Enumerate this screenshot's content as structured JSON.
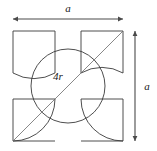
{
  "figure": {
    "kind": "geometry-diagram",
    "background_color": "#ffffff",
    "stroke_color": "#3a3a3a",
    "thin_stroke_color": "#555555",
    "dimension_color": "#4a4a4a",
    "labels": {
      "top_dimension": "a",
      "right_dimension": "a",
      "circle_diameter": "4r"
    },
    "geometry": {
      "square": {
        "x": 13,
        "y": 31,
        "side": 110
      },
      "circle": {
        "cx": 68,
        "cy": 86,
        "r": 37
      },
      "corner_square_size": 42,
      "corner_arc_radius": 42,
      "diagonal": {
        "x1": 13,
        "y1": 141,
        "x2": 123,
        "y2": 31
      }
    },
    "dimensions": {
      "top_line": {
        "x1": 13,
        "x2": 123,
        "y": 19
      },
      "right_line": {
        "x": 135,
        "y1": 31,
        "y2": 141
      },
      "arrow_size": 3.2
    },
    "label_positions": {
      "top": {
        "x": 68,
        "y": 13
      },
      "right": {
        "x": 146,
        "y": 89
      },
      "circle": {
        "x": 58,
        "y": 80
      }
    },
    "font_sizes": {
      "dimension": 11,
      "circle": 11
    }
  }
}
